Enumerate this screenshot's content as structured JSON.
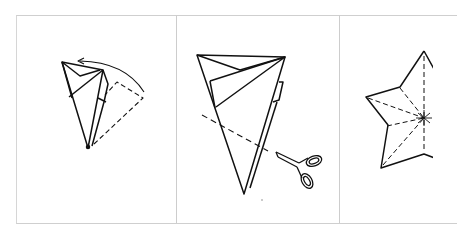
{
  "diagram": {
    "type": "paper-folding instructions",
    "panels": [
      {
        "step": 1,
        "description": "fold-back",
        "elements": [
          "folded-cone",
          "dashed-fold-outline",
          "curved-arrow"
        ]
      },
      {
        "step": 2,
        "description": "cut",
        "elements": [
          "folded-cone",
          "dashed-cut-line",
          "scissors-icon"
        ]
      },
      {
        "step": 3,
        "description": "result",
        "elements": [
          "star-shape",
          "dashed-crease-lines"
        ]
      }
    ],
    "colors": {
      "line": "#111111",
      "border": "#cfcfcf",
      "background": "#ffffff"
    }
  }
}
